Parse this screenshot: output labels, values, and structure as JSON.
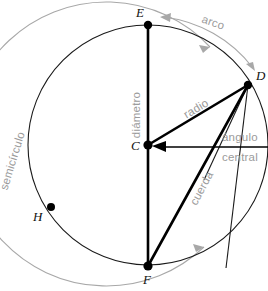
{
  "diagram": {
    "language": "es",
    "colors": {
      "stroke_black": "#000000",
      "circle_outline": "#1a1a1a",
      "label_gray": "#9b9b9b",
      "arc_gray": "#a8a8a8",
      "background": "#ffffff"
    },
    "circle": {
      "center_label": "C",
      "center_x": 148,
      "center_y": 145,
      "radius": 120,
      "outer_guide_radius": 142
    },
    "points": [
      {
        "label": "E",
        "x": 148,
        "y": 25,
        "label_x": 142,
        "label_y": 16,
        "role": "diameter-endpoint-top"
      },
      {
        "label": "D",
        "x": 248,
        "y": 85,
        "label_x": 254,
        "label_y": 80,
        "role": "radius-endpoint"
      },
      {
        "label": "C",
        "x": 148,
        "y": 145,
        "label_x": 135,
        "label_y": 149,
        "role": "center"
      },
      {
        "label": "H",
        "x": 51,
        "y": 207,
        "label_x": 37,
        "label_y": 219,
        "role": "point-on-circle"
      },
      {
        "label": "F",
        "x": 148,
        "y": 266,
        "label_x": 143,
        "label_y": 283,
        "role": "diameter-endpoint-bottom"
      }
    ],
    "segments": [
      {
        "name": "diametro",
        "from": "E",
        "to": "F",
        "label": "diámetro"
      },
      {
        "name": "radio",
        "from": "C",
        "to": "D",
        "label": "radio"
      },
      {
        "name": "cuerda",
        "from": "F",
        "to": "D",
        "label": "cuerda"
      }
    ],
    "labels": {
      "diametro": "diámetro",
      "radio": "radio",
      "cuerda": "cuerda",
      "arco": "arco",
      "semicirculo": "semicírculo",
      "angulo": "ángulo",
      "central": "central"
    }
  }
}
